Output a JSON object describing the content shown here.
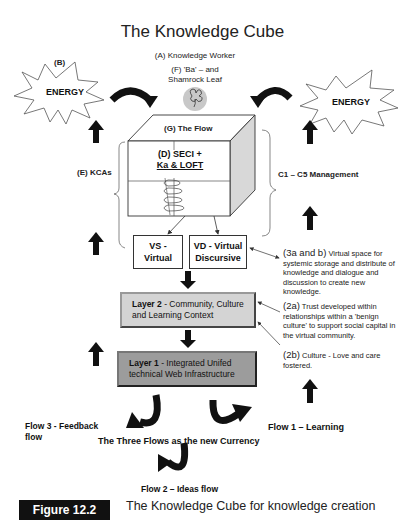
{
  "title": "The Knowledge Cube",
  "labels": {
    "knowledge_worker": "(A) Knowledge Worker",
    "ba_line1": "(F) 'Ba' – and",
    "ba_line2": "Shamrock Leaf",
    "b": "(B)",
    "energy_left": "ENERGY",
    "energy_right": "ENERGY",
    "flow_g": "(G) The Flow",
    "seci_line1": "(D) SECI  +",
    "seci_line2": "Ka & LOFT",
    "kcas": "(E) KCAs",
    "management": "C1 – C5 Management",
    "vs_line1": "VS -",
    "vs_line2": "Virtual",
    "vd_line1": "VD - Virtual",
    "vd_line2": "Discursive"
  },
  "layers": [
    {
      "name": "Layer 2",
      "text": " - Community, Culture and Learning Context",
      "color": "#d4d4d4"
    },
    {
      "name": "Layer 1",
      "text": " - Integrated Unifed technical Web Infrastructure",
      "color": "#9c9c9c"
    }
  ],
  "annotations": {
    "a3_head": "(3a and b)",
    "a3_body": " Virtual space for systemic storage and distribute of knowledge and dialogue and discussion to create new knowledge.",
    "a2a_head": "(2a)",
    "a2a_body": " Trust developed within relationships within a 'benign culture' to support social capital in the virtual community.",
    "a2b_head": "(2b)",
    "a2b_body": " Culture - Love and care fostered."
  },
  "flows": {
    "flow3_line1": "Flow 3 - Feedback",
    "flow3_line2": "flow",
    "flow1": "Flow 1 – Learning",
    "currency": "The Three Flows as the new Currency",
    "flow2": "Flow 2 – Ideas flow"
  },
  "figure": {
    "badge": "Figure 12.2",
    "caption": "The Knowledge Cube for knowledge creation"
  }
}
